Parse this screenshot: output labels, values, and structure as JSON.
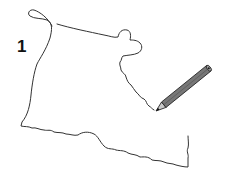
{
  "illustration": {
    "step_number": "1",
    "subject": "boot-outline-tracing",
    "outline_color": "#333333",
    "pencil": {
      "body_color": "#777777",
      "outline_color": "#222222",
      "tip_color": "#111111"
    }
  }
}
